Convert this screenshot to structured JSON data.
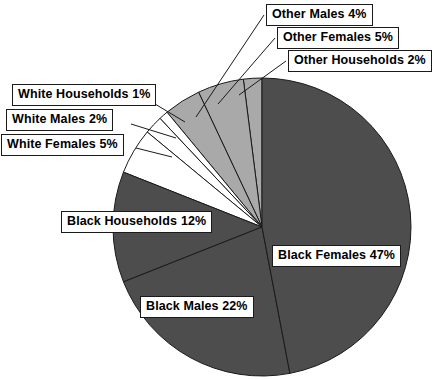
{
  "chart_data": {
    "type": "pie",
    "title": "",
    "subtitle": "",
    "xlabel": "",
    "ylabel": "",
    "legend_position": "none",
    "grid": false,
    "units": "percent",
    "start_angle_deg": 90,
    "direction": "counterclockwise",
    "center": {
      "x": 262,
      "y": 227
    },
    "radius": 149,
    "categories": [
      "Other Households",
      "Other Females",
      "Other Males",
      "White Households",
      "White Males",
      "White Females",
      "Black Households",
      "Black Males",
      "Black Females"
    ],
    "values": [
      2,
      5,
      4,
      1,
      2,
      5,
      12,
      22,
      47
    ],
    "slices": [
      {
        "label": "Other Households",
        "value": 2,
        "label_text": "Other Households 2%",
        "color": "#a9a9a9",
        "group": "other"
      },
      {
        "label": "Other Females",
        "value": 5,
        "label_text": "Other Females 5%",
        "color": "#a9a9a9",
        "group": "other"
      },
      {
        "label": "Other Males",
        "value": 4,
        "label_text": "Other Males 4%",
        "color": "#a9a9a9",
        "group": "other"
      },
      {
        "label": "White Households",
        "value": 1,
        "label_text": "White Households 1%",
        "color": "#ffffff",
        "group": "white"
      },
      {
        "label": "White Males",
        "value": 2,
        "label_text": "White Males 2%",
        "color": "#ffffff",
        "group": "white"
      },
      {
        "label": "White Females",
        "value": 5,
        "label_text": "White Females 5%",
        "color": "#ffffff",
        "group": "white"
      },
      {
        "label": "Black Households",
        "value": 12,
        "label_text": "Black Households 12%",
        "color": "#4d4d4d",
        "group": "black"
      },
      {
        "label": "Black Males",
        "value": 22,
        "label_text": "Black Males 22%",
        "color": "#4d4d4d",
        "group": "black"
      },
      {
        "label": "Black Females",
        "value": 47,
        "label_text": "Black Females 47%",
        "color": "#4d4d4d",
        "group": "black"
      }
    ]
  },
  "colors": {
    "other_slice": "#a9a9a9",
    "white_slice": "#ffffff",
    "black_slice": "#4d4d4d",
    "outline": "#1a1a1a",
    "callout_border": "#1a1a1a",
    "callout_background": "#ffffff",
    "text": "#000000",
    "background": "#ffffff"
  },
  "callouts": {
    "other_males": "Other Males 4%",
    "other_females": "Other Females 5%",
    "other_households": "Other Households 2%",
    "white_households": "White Households 1%",
    "white_males": "White Males 2%",
    "white_females": "White Females 5%",
    "black_households_label": "Black Households",
    "black_households_value": "12%",
    "black_males": "Black Males 22%",
    "black_females": "Black Females 47%"
  }
}
